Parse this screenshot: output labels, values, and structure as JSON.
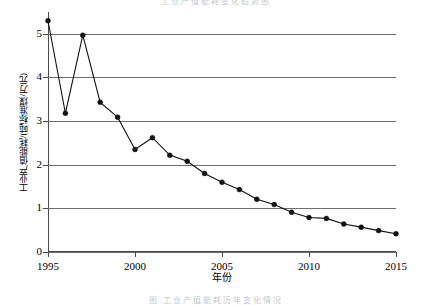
{
  "figure": {
    "ghost_top_text": "工业产值能耗变化趋势图",
    "ghost_bottom_text": "图 工业产值能耗历年变化情况"
  },
  "chart_data": {
    "type": "line",
    "title": "",
    "subtitle": "",
    "xlabel": "年份",
    "ylabel": "工业产值能耗/(吨标准煤/万元)",
    "xlim": [
      1995,
      2015
    ],
    "ylim": [
      0,
      5.5
    ],
    "grid": true,
    "legend_position": "none",
    "x_ticks": [
      1995,
      2000,
      2005,
      2010,
      2015
    ],
    "x_tick_labels": [
      "1995",
      "2000",
      "2005",
      "2010",
      "2015"
    ],
    "y_ticks": [
      0,
      1,
      2,
      3,
      4,
      5
    ],
    "y_tick_labels": [
      "0",
      "1",
      "2",
      "3",
      "4",
      "5"
    ],
    "gridlines_y": [
      0,
      1,
      2,
      3,
      4,
      5
    ],
    "marker": "filled-circle",
    "line_color": "#111111",
    "marker_color": "#111111",
    "grid_color": "#6e6e6e",
    "axis_color": "#4a4a4a",
    "x": [
      1995,
      1996,
      1997,
      1998,
      1999,
      2000,
      2001,
      2002,
      2003,
      2004,
      2005,
      2006,
      2007,
      2008,
      2009,
      2010,
      2011,
      2012,
      2013,
      2014,
      2015
    ],
    "values": [
      5.3,
      3.18,
      4.97,
      3.43,
      3.09,
      2.35,
      2.62,
      2.22,
      2.08,
      1.8,
      1.6,
      1.43,
      1.21,
      1.09,
      0.91,
      0.79,
      0.77,
      0.64,
      0.57,
      0.49,
      0.42
    ],
    "series": [
      {
        "name": "工业产值能耗",
        "values": [
          5.3,
          3.18,
          4.97,
          3.43,
          3.09,
          2.35,
          2.62,
          2.22,
          2.08,
          1.8,
          1.6,
          1.43,
          1.21,
          1.09,
          0.91,
          0.79,
          0.77,
          0.64,
          0.57,
          0.49,
          0.42
        ]
      }
    ],
    "annotations": []
  }
}
